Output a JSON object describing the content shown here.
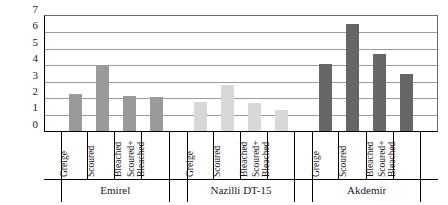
{
  "chart_data": {
    "type": "bar",
    "title": "",
    "xlabel": "",
    "ylabel": "K/S  (Color strength)",
    "ylim": [
      0,
      7
    ],
    "yticks": [
      0,
      1,
      2,
      3,
      4,
      5,
      6,
      7
    ],
    "grid": true,
    "legend": "none",
    "categories": [
      "Greige",
      "Scoured",
      "Bleached",
      "Scoured+\nBleached"
    ],
    "groups": [
      {
        "name": "Emirel",
        "color": "#9a9a9a",
        "categories": [
          "Greige",
          "Scoured",
          "Bleached",
          "Scoured+ Bleached"
        ],
        "values": [
          2.25,
          4.0,
          2.15,
          2.1
        ]
      },
      {
        "name": "Nazilli DT-15",
        "color": "#d8d8d8",
        "categories": [
          "Greige",
          "Scoured",
          "Bleached",
          "Scoured+ Bleached"
        ],
        "values": [
          1.75,
          2.8,
          1.7,
          1.3
        ]
      },
      {
        "name": "Akdemir",
        "color": "#666666",
        "categories": [
          "Greige",
          "Scoured",
          "Bleached",
          "Scoured+ Bleached"
        ],
        "values": [
          4.05,
          6.5,
          4.7,
          3.5
        ]
      }
    ],
    "bar_labels": [
      {
        "line1": "Greige",
        "line2": ""
      },
      {
        "line1": "Scoured",
        "line2": ""
      },
      {
        "line1": "Bleached",
        "line2": ""
      },
      {
        "line1": "Scoured+",
        "line2": "Bleached"
      }
    ]
  },
  "axis": {
    "tick_7": "7",
    "tick_6": "6",
    "tick_5": "5",
    "tick_4": "4",
    "tick_3": "3",
    "tick_2": "2",
    "tick_1": "1",
    "tick_0": "0",
    "y_title": "K/S  (Color strength)"
  },
  "varieties": {
    "g0": "Emirel",
    "g1": "Nazilli DT-15",
    "g2": "Akdemir"
  },
  "colors": {
    "series_emirel": "#9a9a9a",
    "series_nazilli": "#d8d8d8",
    "series_akdemir": "#666666",
    "gridline": "#9c9c9c",
    "axis": "#000000",
    "background": "#ffffff"
  }
}
